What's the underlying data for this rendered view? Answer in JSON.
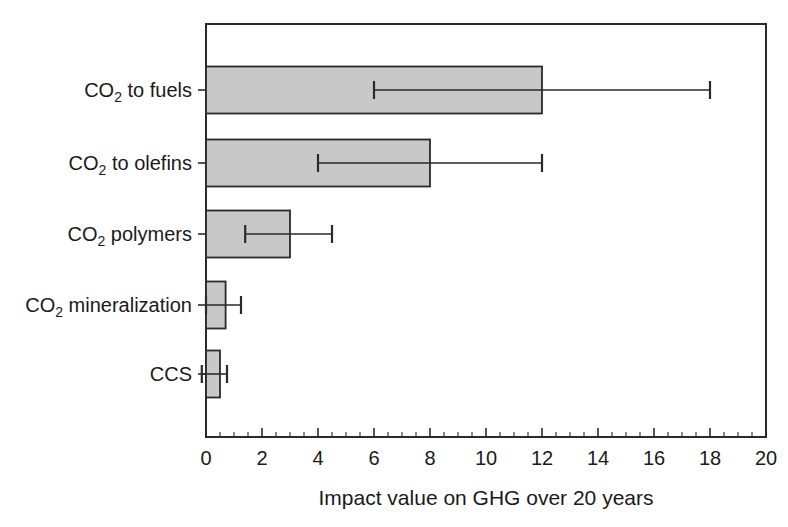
{
  "chart_data": {
    "type": "bar",
    "orientation": "horizontal",
    "title": "",
    "xlabel": "Impact value on GHG over 20 years",
    "ylabel": "",
    "xlim": [
      0,
      20
    ],
    "grid": false,
    "legend": null,
    "xticks": [
      0,
      2,
      4,
      6,
      8,
      10,
      12,
      14,
      16,
      18,
      20
    ],
    "xtick_labels": [
      "0",
      "2",
      "4",
      "6",
      "8",
      "10",
      "12",
      "14",
      "16",
      "18",
      "20"
    ],
    "x_minor_tick_step": 0.5,
    "categories": [
      "CO2 to fuels",
      "CO2 to olefins",
      "CO2 polymers",
      "CO2 mineralization",
      "CCS"
    ],
    "category_labels_rich": [
      {
        "pre": "CO",
        "sub": "2",
        "post": " to fuels"
      },
      {
        "pre": "CO",
        "sub": "2",
        "post": " to olefins"
      },
      {
        "pre": "CO",
        "sub": "2",
        "post": " polymers"
      },
      {
        "pre": "CO",
        "sub": "2",
        "post": " mineralization"
      },
      {
        "pre": "CCS",
        "sub": "",
        "post": ""
      }
    ],
    "values": [
      12.0,
      8.0,
      3.0,
      0.7,
      0.5
    ],
    "error_low": [
      6.0,
      4.0,
      1.4,
      0.0,
      -0.15
    ],
    "error_high": [
      18.0,
      12.0,
      4.5,
      1.25,
      0.75
    ],
    "bar_fill_color": "#c8c8c8",
    "bar_edge_color": "#2a2a2a",
    "error_bar_color": "#2a2a2a"
  },
  "figure": {
    "background_color": "#ffffff",
    "plot_left_px": 206,
    "plot_right_px": 766,
    "plot_top_px": 24,
    "plot_bottom_px": 437,
    "bar_height_px": 47,
    "bar_centers_px": [
      90,
      163,
      234,
      305,
      374
    ]
  }
}
